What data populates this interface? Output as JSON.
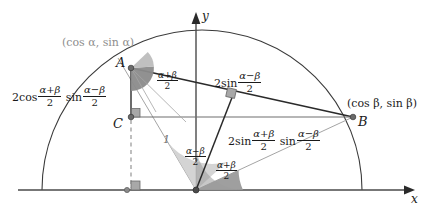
{
  "figure": {
    "type": "geometry-diagram",
    "axes": {
      "x_label": "x",
      "y_label": "y"
    },
    "points": {
      "A": {
        "label": "A",
        "coord_label": "(cos α, sin α)"
      },
      "B": {
        "label": "B",
        "coord_label": "(cos β, sin β)"
      },
      "C": {
        "label": "C"
      }
    },
    "radius_label": "1",
    "segments": {
      "vertical_AC": {
        "prefix": "2",
        "fn1": "cos",
        "num1": "α+β",
        "den1": "2",
        "fn2": "sin",
        "num2": "α−β",
        "den2": "2"
      },
      "chord_AB": {
        "prefix": "2",
        "fn1": "sin",
        "num1": "α−β",
        "den1": "2"
      },
      "perp_from_origin": {
        "prefix": "2",
        "fn1": "sin",
        "num1": "α+β",
        "den1": "2",
        "fn2": "sin",
        "num2": "α−β",
        "den2": "2"
      }
    },
    "angles": {
      "at_A": {
        "num": "α+β",
        "den": "2"
      },
      "at_origin_outer": {
        "num": "α−β",
        "den": "2"
      },
      "at_origin_inner": {
        "num": "α+β",
        "den": "2"
      }
    },
    "colors": {
      "stroke": "#3a3a3a",
      "gray_text": "#8d8d8d",
      "wedge_dark": "#8b8b8b",
      "wedge_light": "#c4c4c4",
      "marker_fill": "#a8a8a8",
      "thin_line": "#9a9a9a"
    }
  }
}
